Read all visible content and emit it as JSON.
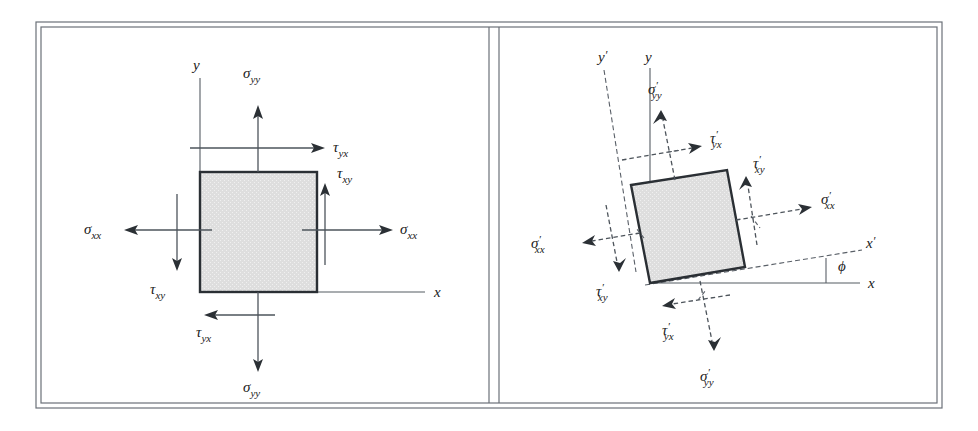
{
  "figure": {
    "colors": {
      "square_fill": "#dcdcdc",
      "square_stroke": "#2a2f34",
      "line": "#555c63",
      "frame": "#6b7178",
      "text": "#1a1a1a"
    },
    "background": "#ffffff"
  },
  "panels": [
    {
      "id": "left-panel",
      "name": "unrotated-stress-element",
      "axes": [
        {
          "name": "y-axis",
          "label": "y",
          "style": "solid"
        },
        {
          "name": "x-axis",
          "label": "x",
          "style": "solid"
        }
      ],
      "element": {
        "name": "stress-square",
        "rotation_deg": 0,
        "fill": "#dcdcdc"
      },
      "stress_labels": [
        {
          "name": "sigma-yy-top",
          "symbol": "σ",
          "sub": "yy",
          "prime": false,
          "direction": "up",
          "face": "top"
        },
        {
          "name": "tau-yx-top",
          "symbol": "τ",
          "sub": "yx",
          "prime": false,
          "direction": "right",
          "face": "top"
        },
        {
          "name": "tau-xy-right",
          "symbol": "τ",
          "sub": "xy",
          "prime": false,
          "direction": "up",
          "face": "right"
        },
        {
          "name": "sigma-xx-right",
          "symbol": "σ",
          "sub": "xx",
          "prime": false,
          "direction": "right",
          "face": "right"
        },
        {
          "name": "sigma-xx-left",
          "symbol": "σ",
          "sub": "xx",
          "prime": false,
          "direction": "left",
          "face": "left"
        },
        {
          "name": "tau-xy-left",
          "symbol": "τ",
          "sub": "xy",
          "prime": false,
          "direction": "down",
          "face": "left"
        },
        {
          "name": "tau-yx-bottom",
          "symbol": "τ",
          "sub": "yx",
          "prime": false,
          "direction": "left",
          "face": "bottom"
        },
        {
          "name": "sigma-yy-bottom",
          "symbol": "σ",
          "sub": "yy",
          "prime": false,
          "direction": "down",
          "face": "bottom"
        }
      ]
    },
    {
      "id": "right-panel",
      "name": "rotated-stress-element",
      "axes": [
        {
          "name": "y-axis",
          "label": "y",
          "style": "solid"
        },
        {
          "name": "x-axis",
          "label": "x",
          "style": "solid"
        },
        {
          "name": "y-prime-axis",
          "label": "y",
          "prime": true,
          "style": "dashed"
        },
        {
          "name": "x-prime-axis",
          "label": "x",
          "prime": true,
          "style": "dashed"
        }
      ],
      "angle": {
        "name": "rotation-angle",
        "label": "ϕ"
      },
      "element": {
        "name": "stress-square-rotated",
        "rotation_deg": -9,
        "fill": "#dcdcdc"
      },
      "stress_labels": [
        {
          "name": "sigma-yy-prime-top",
          "symbol": "σ",
          "sub": "yy",
          "prime": true,
          "direction": "up",
          "face": "top"
        },
        {
          "name": "tau-yx-prime-top",
          "symbol": "τ",
          "sub": "yx",
          "prime": true,
          "direction": "right",
          "face": "top"
        },
        {
          "name": "tau-xy-prime-right",
          "symbol": "τ",
          "sub": "xy",
          "prime": true,
          "direction": "up",
          "face": "right"
        },
        {
          "name": "sigma-xx-prime-right",
          "symbol": "σ",
          "sub": "xx",
          "prime": true,
          "direction": "right",
          "face": "right"
        },
        {
          "name": "sigma-xx-prime-left",
          "symbol": "σ",
          "sub": "xx",
          "prime": true,
          "direction": "left",
          "face": "left"
        },
        {
          "name": "tau-xy-prime-left",
          "symbol": "τ",
          "sub": "xy",
          "prime": true,
          "direction": "down",
          "face": "left"
        },
        {
          "name": "tau-yx-prime-bottom",
          "symbol": "τ",
          "sub": "yx",
          "prime": true,
          "direction": "left",
          "face": "bottom"
        },
        {
          "name": "sigma-yy-prime-bottom",
          "symbol": "σ",
          "sub": "yy",
          "prime": true,
          "direction": "down",
          "face": "bottom"
        }
      ]
    }
  ],
  "text": {
    "sigma": "σ",
    "tau": "τ",
    "phi": "ϕ",
    "prime": "′",
    "sub_xx": "xx",
    "sub_yy": "yy",
    "sub_xy": "xy",
    "sub_yx": "yx",
    "axis_x": "x",
    "axis_y": "y"
  }
}
